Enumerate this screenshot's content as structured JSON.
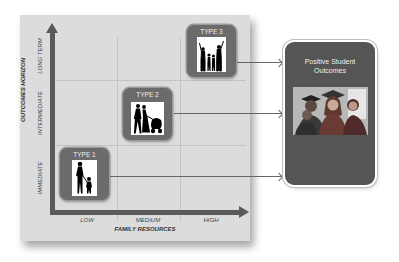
{
  "diagram": {
    "x_axis": {
      "title": "FAMILY RESOURCES",
      "ticks": [
        "LOW",
        "MEDIUM",
        "HIGH"
      ]
    },
    "y_axis": {
      "title": "OUTCOMES HORIZON",
      "ticks": [
        "IMMEDIATE",
        "INTERMEDIATE",
        "LONG TERM"
      ]
    },
    "types": [
      {
        "label": "TYPE 1",
        "icon": "parent-child-silhouette-icon",
        "resources": "LOW",
        "horizon": "IMMEDIATE"
      },
      {
        "label": "TYPE 2",
        "icon": "couple-with-stroller-silhouette-icon",
        "resources": "MEDIUM",
        "horizon": "INTERMEDIATE"
      },
      {
        "label": "TYPE 3",
        "icon": "family-celebrating-silhouette-icon",
        "resources": "HIGH",
        "horizon": "LONG TERM"
      }
    ],
    "outcome": {
      "title_line1": "Positive Student",
      "title_line2": "Outcomes",
      "photo": "graduates-photo"
    },
    "colors": {
      "panel": "#dcdcdc",
      "axis": "#5a5a5a",
      "type_box": "#6b6b6b",
      "outcome_box": "#555555"
    }
  }
}
